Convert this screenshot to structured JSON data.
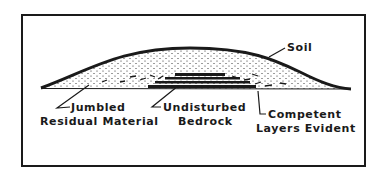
{
  "diagram": {
    "labels": {
      "soil": "Soil",
      "jumbled_line1": "Jumbled",
      "jumbled_line2": "Residual Material",
      "bedrock_line1": "Undisturbed",
      "bedrock_line2": "Bedrock",
      "competent_line1": "Competent",
      "competent_line2": "Layers Evident"
    },
    "colors": {
      "ink": "#1a1a1a",
      "background": "#ffffff"
    }
  }
}
